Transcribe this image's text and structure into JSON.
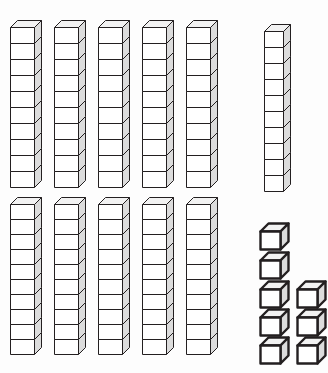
{
  "diagram": {
    "kind": "base-ten-blocks",
    "projection": "oblique-cabinet",
    "background_color": "#fdfdfd",
    "stroke_color": "#231f20",
    "face_colors": {
      "front": "#ffffff",
      "top": "#f2f2f2",
      "side": "#dcdcdc"
    },
    "total_value": 118,
    "counts": {
      "rods_tens": 11,
      "units_ones": 8,
      "cubes_per_rod": 10
    },
    "groups": [
      {
        "name": "top-row-rods",
        "label": "Top row of ten-rods",
        "item_type": "ten-rod",
        "count": 5,
        "cubes_each": 10,
        "value_each": 10,
        "cube_w": 24,
        "cube_h": 16,
        "depth": 7,
        "origins": [
          {
            "x": 10,
            "y": 28
          },
          {
            "x": 54,
            "y": 28
          },
          {
            "x": 98,
            "y": 28
          },
          {
            "x": 142,
            "y": 28
          },
          {
            "x": 186,
            "y": 28
          }
        ]
      },
      {
        "name": "tall-single-rod",
        "label": "Separate ten-rod at right",
        "item_type": "ten-rod",
        "count": 1,
        "cubes_each": 10,
        "value_each": 10,
        "cube_w": 19,
        "cube_h": 16,
        "depth": 7,
        "origins": [
          {
            "x": 264,
            "y": 32
          }
        ]
      },
      {
        "name": "bottom-row-rods",
        "label": "Bottom row of ten-rods",
        "item_type": "ten-rod",
        "count": 5,
        "cubes_each": 10,
        "value_each": 10,
        "cube_w": 24,
        "cube_h": 15,
        "depth": 7,
        "origins": [
          {
            "x": 10,
            "y": 205
          },
          {
            "x": 54,
            "y": 205
          },
          {
            "x": 98,
            "y": 205
          },
          {
            "x": 142,
            "y": 205
          },
          {
            "x": 186,
            "y": 205
          }
        ]
      },
      {
        "name": "unit-cubes",
        "label": "Loose unit cubes",
        "item_type": "unit-cube",
        "count": 8,
        "value_each": 1,
        "cube_w": 20,
        "cube_h": 18,
        "depth": 8,
        "origins": [
          {
            "x": 260,
            "y": 232
          },
          {
            "x": 260,
            "y": 261
          },
          {
            "x": 260,
            "y": 290
          },
          {
            "x": 297,
            "y": 290
          },
          {
            "x": 260,
            "y": 318
          },
          {
            "x": 297,
            "y": 318
          },
          {
            "x": 260,
            "y": 346
          },
          {
            "x": 297,
            "y": 346
          }
        ]
      }
    ]
  }
}
